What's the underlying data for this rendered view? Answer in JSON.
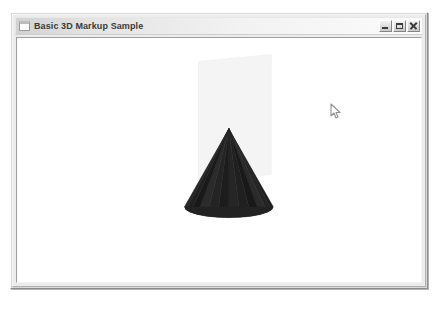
{
  "window": {
    "title": "Basic 3D Markup Sample",
    "icon_name": "window-icon",
    "controls": {
      "minimize_label": "Minimize",
      "maximize_label": "Maximize",
      "close_label": "Close"
    }
  },
  "viewport": {
    "name": "3d-viewport",
    "background_color": "#ffffff",
    "objects": [
      {
        "name": "backdrop-plane",
        "type": "plane",
        "fill_color": "#f4f4f4",
        "stroke_color": "#ededed",
        "points": "194,60 268,53 268,171 194,176"
      },
      {
        "name": "cone-mesh",
        "type": "cone",
        "fill_color": "#222222",
        "facet_colors": [
          "#1c1c1c",
          "#242424",
          "#2b2b2b",
          "#191919",
          "#202020",
          "#262626"
        ],
        "apex": "228,127",
        "base_center": "228,207",
        "base_rx": "45",
        "base_ry": "11",
        "segments": 12
      }
    ]
  },
  "cursor": {
    "name": "mouse-pointer",
    "x": 317,
    "y": 70,
    "color": "#9a9a9a"
  }
}
